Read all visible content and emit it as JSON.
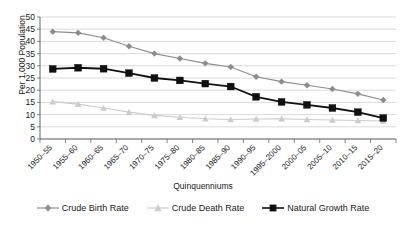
{
  "chart_data": {
    "type": "line",
    "title": "",
    "xlabel": "Quinquenniums",
    "ylabel": "Per 1,000 Population",
    "ylim": [
      0,
      50
    ],
    "ytick_step": 5,
    "yticks": [
      "50",
      "45",
      "40",
      "35",
      "30",
      "25",
      "20",
      "15",
      "10",
      "5",
      "0"
    ],
    "grid": true,
    "legend_position": "bottom",
    "categories": [
      "1950–55",
      "1955–60",
      "1960–65",
      "1965–70",
      "1970–75",
      "1975–80",
      "1980–85",
      "1985–90",
      "1990–95",
      "1995–2000",
      "2000–05",
      "2005–10",
      "2010–15",
      "2015–20"
    ],
    "series": [
      {
        "name": "Crude Birth Rate",
        "color": "#8c8c8c",
        "marker": "diamond",
        "values": [
          44.0,
          43.5,
          41.5,
          38.0,
          35.0,
          33.0,
          31.0,
          29.5,
          25.5,
          23.5,
          22.0,
          20.5,
          18.5,
          16.0
        ]
      },
      {
        "name": "Crude Death Rate",
        "color": "#cccccc",
        "marker": "triangle",
        "values": [
          15.3,
          14.3,
          12.7,
          11.0,
          9.7,
          8.9,
          8.3,
          8.0,
          8.2,
          8.3,
          8.0,
          7.8,
          7.6,
          7.4
        ]
      },
      {
        "name": "Natural Growth Rate",
        "color": "#111111",
        "marker": "square",
        "values": [
          28.7,
          29.2,
          28.8,
          27.0,
          25.0,
          24.0,
          22.7,
          21.5,
          17.3,
          15.2,
          14.0,
          12.7,
          11.0,
          8.6
        ]
      }
    ]
  },
  "legend": {
    "items": [
      {
        "label": "Crude Birth Rate"
      },
      {
        "label": "Crude Death Rate"
      },
      {
        "label": "Natural Growth Rate"
      }
    ]
  },
  "axes": {
    "x_title": "Quinquenniums",
    "y_title": "Per 1,000 Population"
  }
}
